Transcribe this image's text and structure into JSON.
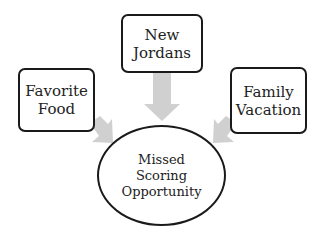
{
  "diagram": {
    "type": "cause-effect",
    "nodes": [
      {
        "id": "new-jordans",
        "shape": "rounded-rectangle",
        "lines": [
          "New",
          "Jordans"
        ]
      },
      {
        "id": "favorite-food",
        "shape": "rounded-rectangle",
        "lines": [
          "Favorite",
          "Food"
        ]
      },
      {
        "id": "family-vacation",
        "shape": "rounded-rectangle",
        "lines": [
          "Family",
          "Vacation"
        ]
      },
      {
        "id": "missed-scoring-opportunity",
        "shape": "ellipse",
        "lines": [
          "Missed",
          "Scoring",
          "Opportunity"
        ]
      }
    ],
    "edges": [
      {
        "from": "new-jordans",
        "to": "missed-scoring-opportunity"
      },
      {
        "from": "favorite-food",
        "to": "missed-scoring-opportunity"
      },
      {
        "from": "family-vacation",
        "to": "missed-scoring-opportunity"
      }
    ],
    "colors": {
      "border": "#1a1a1a",
      "arrow": "#d0d0d0",
      "background": "#ffffff"
    }
  }
}
